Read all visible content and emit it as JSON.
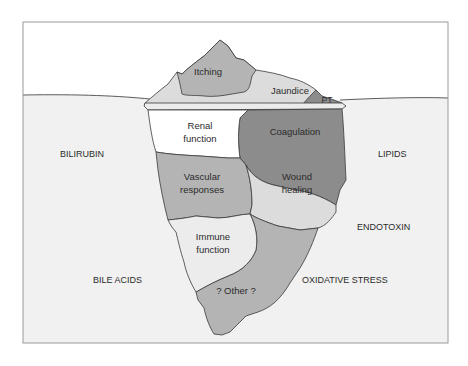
{
  "figure": {
    "type": "iceberg-diagram",
    "colors": {
      "sky": "#ffffff",
      "water": "#f1f1f1",
      "frame": "#9a9a9a",
      "outline": "#3a3a3a",
      "light_gray": "#dcdcdc",
      "mid_gray": "#b4b4b4",
      "dark_gray": "#8c8c8c",
      "white_region": "#ffffff",
      "very_light": "#ececec"
    },
    "above_water": [
      {
        "id": "itching",
        "label": "Itching"
      },
      {
        "id": "jaundice",
        "label": "Jaundice"
      },
      {
        "id": "pt",
        "label": "PT"
      }
    ],
    "below_water": [
      {
        "id": "renal",
        "label_line1": "Renal",
        "label_line2": "function"
      },
      {
        "id": "coagulation",
        "label": "Coagulation"
      },
      {
        "id": "vascular",
        "label_line1": "Vascular",
        "label_line2": "responses"
      },
      {
        "id": "wound",
        "label_line1": "Wound",
        "label_line2": "healing"
      },
      {
        "id": "immune",
        "label_line1": "Immune",
        "label_line2": "function"
      },
      {
        "id": "other",
        "label": "? Other ?"
      }
    ],
    "side_factors": {
      "left": [
        "BILIRUBIN",
        "BILE ACIDS"
      ],
      "right": [
        "LIPIDS",
        "ENDOTOXIN",
        "OXIDATIVE STRESS"
      ]
    }
  }
}
